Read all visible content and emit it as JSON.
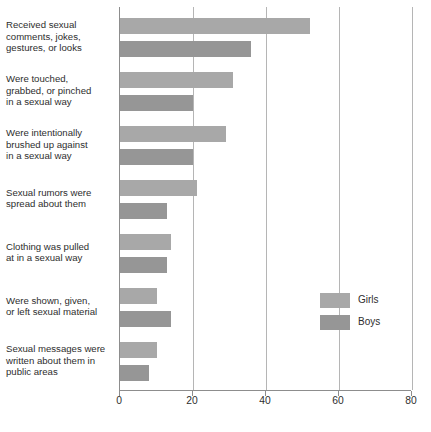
{
  "chart_data": {
    "type": "bar",
    "orientation": "horizontal",
    "title": "",
    "xlabel": "",
    "ylabel": "",
    "xlim": [
      0,
      80
    ],
    "xticks": [
      0,
      20,
      40,
      60,
      80
    ],
    "grid": true,
    "legend_position": "right-middle",
    "categories": [
      "Received sexual comments, jokes, gestures, or looks",
      "Were touched, grabbed, or pinched in a sexual way",
      "Were intentionally brushed up against in a sexual way",
      "Sexual rumors were spread about them",
      "Clothing was pulled at in a sexual way",
      "Were shown, given, or left sexual material",
      "Sexual messages were written about them in public areas"
    ],
    "category_lines": [
      [
        "Received sexual",
        "comments, jokes,",
        "gestures, or looks"
      ],
      [
        "Were touched,",
        "grabbed, or pinched",
        "in a sexual way"
      ],
      [
        "Were intentionally",
        "brushed up against",
        "in a sexual way"
      ],
      [
        "Sexual rumors were",
        "spread about them"
      ],
      [
        "Clothing was pulled",
        "at in a sexual way"
      ],
      [
        "Were shown, given,",
        "or left sexual material"
      ],
      [
        "Sexual messages were",
        "written about them in",
        "public areas"
      ]
    ],
    "series": [
      {
        "name": "Girls",
        "color": "#a8a8a8",
        "values": [
          52,
          31,
          29,
          21,
          14,
          10,
          10
        ]
      },
      {
        "name": "Boys",
        "color": "#969696",
        "values": [
          36,
          20,
          20,
          13,
          13,
          14,
          8
        ]
      }
    ]
  },
  "legend": {
    "items": [
      {
        "label": "Girls"
      },
      {
        "label": "Boys"
      }
    ]
  },
  "axis": {
    "tick_labels": [
      "0",
      "20",
      "40",
      "60",
      "80"
    ]
  }
}
